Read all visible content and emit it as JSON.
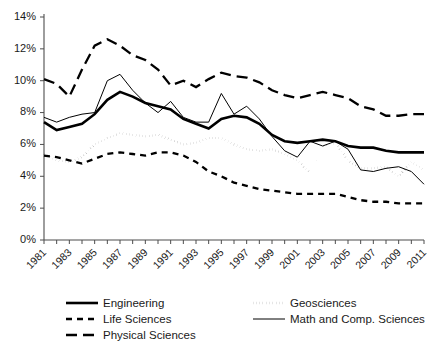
{
  "chart_data": {
    "type": "line",
    "title": "",
    "xlabel": "",
    "ylabel": "",
    "grid": false,
    "legend_position": "bottom",
    "xlim": [
      1981,
      2011
    ],
    "ylim": [
      0,
      14
    ],
    "x": [
      1981,
      1982,
      1983,
      1984,
      1985,
      1986,
      1987,
      1988,
      1989,
      1990,
      1991,
      1992,
      1993,
      1994,
      1995,
      1996,
      1997,
      1998,
      1999,
      2000,
      2001,
      2002,
      2003,
      2004,
      2005,
      2006,
      2007,
      2008,
      2009,
      2010,
      2011
    ],
    "x_tick_labels": [
      "1981",
      "1983",
      "1985",
      "1987",
      "1989",
      "1991",
      "1993",
      "1995",
      "1997",
      "1999",
      "2001",
      "2003",
      "2005",
      "2007",
      "2009",
      "2011"
    ],
    "y_tick_labels": [
      "0%",
      "2%",
      "4%",
      "6%",
      "8%",
      "10%",
      "12%",
      "14%"
    ],
    "y_ticks": [
      0,
      2,
      4,
      6,
      8,
      10,
      12,
      14
    ],
    "series": [
      {
        "name": "Engineering",
        "style": "solid-thick",
        "values": [
          7.4,
          6.9,
          7.1,
          7.3,
          7.9,
          8.8,
          9.3,
          9.0,
          8.6,
          8.4,
          8.2,
          7.6,
          7.3,
          7.0,
          7.6,
          7.8,
          7.7,
          7.3,
          6.6,
          6.2,
          6.1,
          6.2,
          6.3,
          6.2,
          5.9,
          5.8,
          5.8,
          5.6,
          5.5,
          5.5,
          5.5
        ]
      },
      {
        "name": "Life Sciences",
        "style": "dashed-medium",
        "values": [
          5.3,
          5.2,
          5.0,
          4.8,
          5.1,
          5.4,
          5.5,
          5.4,
          5.3,
          5.5,
          5.5,
          5.3,
          4.9,
          4.3,
          4.0,
          3.6,
          3.4,
          3.2,
          3.1,
          3.0,
          2.9,
          2.9,
          2.9,
          2.9,
          2.7,
          2.5,
          2.4,
          2.4,
          2.3,
          2.3,
          2.3
        ]
      },
      {
        "name": "Physical Sciences",
        "style": "dashed-long",
        "values": [
          10.1,
          9.8,
          9.0,
          10.7,
          12.2,
          12.6,
          12.2,
          11.6,
          11.3,
          10.7,
          9.7,
          10.0,
          9.6,
          10.1,
          10.5,
          10.3,
          10.2,
          9.9,
          9.4,
          9.1,
          8.9,
          9.1,
          9.3,
          9.1,
          8.9,
          8.4,
          8.2,
          7.8,
          7.8,
          7.9,
          7.9
        ]
      },
      {
        "name": "Geosciences",
        "style": "dotted",
        "values": [
          5.4,
          5.0,
          4.9,
          5.2,
          6.0,
          6.4,
          6.7,
          6.6,
          6.5,
          6.6,
          6.3,
          6.0,
          6.1,
          6.4,
          6.4,
          6.0,
          5.7,
          5.6,
          5.7,
          5.4,
          5.0,
          4.2,
          5.9,
          6.1,
          5.0,
          4.5,
          4.5,
          4.6,
          4.0,
          4.9,
          4.4
        ]
      },
      {
        "name": "Math and Comp. Sciences",
        "style": "solid-thin",
        "values": [
          7.7,
          7.4,
          7.7,
          7.9,
          8.0,
          10.0,
          10.4,
          9.4,
          8.6,
          8.0,
          8.7,
          7.7,
          7.4,
          7.4,
          9.2,
          7.9,
          8.4,
          7.6,
          6.5,
          5.6,
          5.2,
          6.2,
          5.9,
          6.2,
          5.7,
          4.4,
          4.3,
          4.5,
          4.6,
          4.3,
          3.5
        ]
      }
    ]
  },
  "legend": {
    "entries": [
      {
        "label": "Engineering",
        "style": "solid-thick"
      },
      {
        "label": "Geosciences",
        "style": "dotted"
      },
      {
        "label": "Life Sciences",
        "style": "dashed-medium"
      },
      {
        "label": "Math and Comp. Sciences",
        "style": "solid-thin"
      },
      {
        "label": "Physical Sciences",
        "style": "dashed-long"
      }
    ]
  },
  "colors": {
    "line": "#000000",
    "axis": "#4d4d4d",
    "background": "#ffffff",
    "text": "#1a1a1a"
  }
}
